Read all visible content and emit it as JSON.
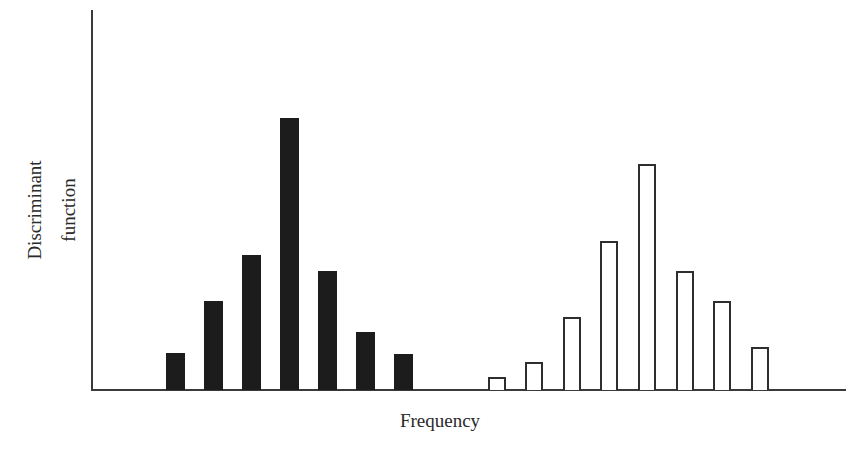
{
  "chart_data": {
    "type": "bar",
    "title": "",
    "xlabel": "Frequency",
    "ylabel": "Discriminant function",
    "ylabel_lines": [
      "Discriminant",
      "function"
    ],
    "grid": false,
    "legend": null,
    "tick_labels": false,
    "ylim": [
      0,
      380
    ],
    "series": [
      {
        "name": "Group 1 (filled)",
        "style": "filled",
        "color": "#1c1c1c",
        "x_px": [
          166,
          204,
          242,
          280,
          318,
          356,
          394
        ],
        "values": [
          37,
          89,
          135,
          272,
          119,
          58,
          36
        ]
      },
      {
        "name": "Group 2 (outlined)",
        "style": "outline",
        "color": "#2e2e2e",
        "x_px": [
          488,
          525,
          563,
          600,
          638,
          676,
          713,
          751
        ],
        "values": [
          13,
          28,
          73,
          149,
          226,
          119,
          89,
          43
        ]
      }
    ]
  },
  "labels": {
    "ylabel_line1": "Discriminant",
    "ylabel_line2": "function",
    "xlabel": "Frequency"
  },
  "layout": {
    "baseline_y": 390,
    "bar_width": 19
  }
}
